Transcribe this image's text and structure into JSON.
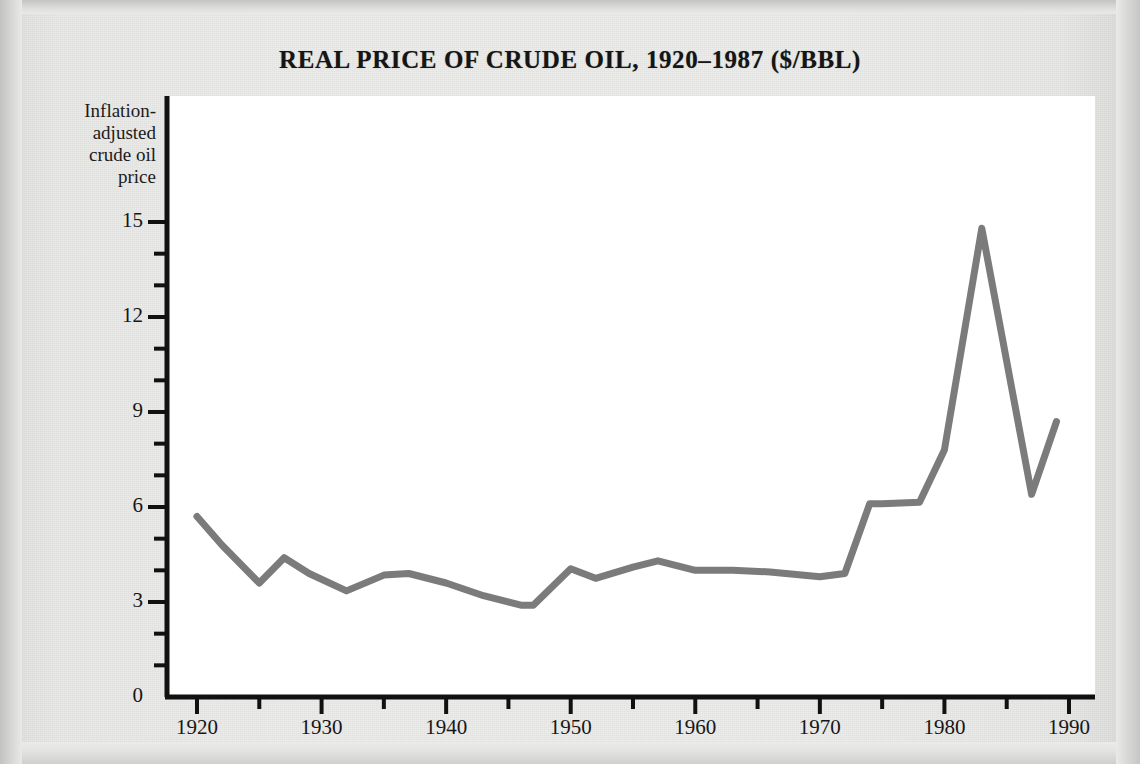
{
  "figure": {
    "title": "REAL PRICE OF CRUDE OIL, 1920–1987 ($/BBL)",
    "y_axis_label": "Inflation-\nadjusted\ncrude oil\nprice",
    "y_axis_label_lines": [
      "Inflation-",
      "adjusted",
      "crude oil",
      "price"
    ],
    "line_color": "#7b7b7b",
    "axis_color": "#111111",
    "panel_color": "#ffffff",
    "page_color": "#ebebe9"
  },
  "chart_data": {
    "type": "line",
    "title": "REAL PRICE OF CRUDE OIL, 1920–1987 ($/BBL)",
    "xlabel": "",
    "ylabel": "Inflation-adjusted crude oil price",
    "xlim": [
      1918,
      1991
    ],
    "ylim": [
      0,
      16
    ],
    "grid": false,
    "legend": "none",
    "x_major_ticks": [
      1920,
      1930,
      1940,
      1950,
      1960,
      1970,
      1980,
      1990
    ],
    "x_minor_ticks": [
      1925,
      1935,
      1945,
      1955,
      1965,
      1975,
      1985
    ],
    "x_tick_labels": [
      "1920",
      "1930",
      "1940",
      "1950",
      "1960",
      "1970",
      "1980",
      "1990"
    ],
    "y_major_ticks": [
      0,
      3,
      6,
      9,
      12,
      15
    ],
    "y_minor_ticks": [
      1,
      2,
      4,
      5,
      7,
      8,
      10,
      11,
      13,
      14
    ],
    "y_tick_labels": [
      "0",
      "3",
      "6",
      "9",
      "12",
      "15"
    ],
    "series": [
      {
        "name": "Inflation-adjusted crude oil price ($/BBL)",
        "color": "#7b7b7b",
        "x": [
          1920,
          1922,
          1925,
          1927,
          1929,
          1932,
          1935,
          1937,
          1940,
          1943,
          1946,
          1947,
          1950,
          1952,
          1955,
          1957,
          1960,
          1963,
          1966,
          1970,
          1972,
          1974,
          1975,
          1978,
          1980,
          1983,
          1987,
          1989
        ],
        "values": [
          5.7,
          4.8,
          3.6,
          4.4,
          3.9,
          3.35,
          3.85,
          3.9,
          3.6,
          3.2,
          2.9,
          2.9,
          4.05,
          3.75,
          4.1,
          4.3,
          4.0,
          4.0,
          3.95,
          3.8,
          3.9,
          6.1,
          6.1,
          6.15,
          7.8,
          14.8,
          6.4,
          8.7
        ]
      }
    ]
  }
}
